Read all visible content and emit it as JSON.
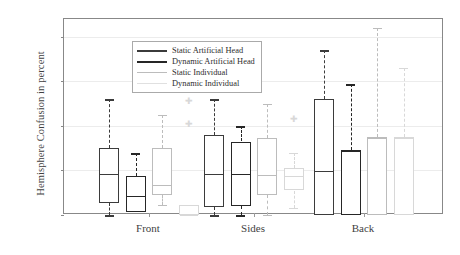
{
  "chart_data": {
    "type": "box",
    "title": "",
    "xlabel": "",
    "ylabel": "Hemisphere Confusion in percent",
    "ylim": [
      0,
      88
    ],
    "yticks": [
      0,
      20,
      40,
      60,
      80
    ],
    "ytick_labels": [
      "0",
      "20",
      "40",
      "60",
      "80"
    ],
    "grid": "horizontal",
    "categories": [
      "Front",
      "Sides",
      "Back"
    ],
    "legend_position": "top-left",
    "series": [
      {
        "name": "Static Artificial Head",
        "color": "#3b3b3b",
        "boxes": [
          {
            "category": "Front",
            "whisker_low": 0,
            "q1": 5.5,
            "median": 19,
            "q3": 30,
            "whisker_high": 52,
            "outliers": []
          },
          {
            "category": "Sides",
            "whisker_low": 0,
            "q1": 3.5,
            "median": 19,
            "q3": 36,
            "whisker_high": 52,
            "outliers": []
          },
          {
            "category": "Back",
            "whisker_low": 0,
            "q1": 0,
            "median": 20,
            "q3": 52,
            "whisker_high": 74,
            "outliers": []
          }
        ]
      },
      {
        "name": "Dynamic Artificial Head",
        "color": "#262626",
        "boxes": [
          {
            "category": "Front",
            "whisker_low": 1.5,
            "q1": 1.5,
            "median": 9,
            "q3": 17.5,
            "whisker_high": 28,
            "outliers": [
              62
            ]
          },
          {
            "category": "Sides",
            "whisker_low": 0,
            "q1": 4,
            "median": 19,
            "q3": 33,
            "whisker_high": 40,
            "outliers": []
          },
          {
            "category": "Back",
            "whisker_low": 0,
            "q1": 0,
            "median": 29,
            "q3": 29,
            "whisker_high": 59,
            "outliers": []
          }
        ]
      },
      {
        "name": "Static Individual",
        "color": "#bcbcbc",
        "boxes": [
          {
            "category": "Front",
            "whisker_low": 4.5,
            "q1": 9,
            "median": 14,
            "q3": 30,
            "whisker_high": 45,
            "outliers": [
              64
            ]
          },
          {
            "category": "Sides",
            "whisker_low": 0,
            "q1": 9,
            "median": 18.5,
            "q3": 34.5,
            "whisker_high": 50,
            "outliers": []
          },
          {
            "category": "Back",
            "whisker_low": 0,
            "q1": 0,
            "median": 35,
            "q3": 35,
            "whisker_high": 84,
            "outliers": []
          }
        ]
      },
      {
        "name": "Dynamic Individual",
        "color": "#d8d8d8",
        "boxes": [
          {
            "category": "Front",
            "whisker_low": 0,
            "q1": 0,
            "median": 0,
            "q3": 4.5,
            "whisker_high": 4.5,
            "outliers": [
              51,
              41
            ]
          },
          {
            "category": "Sides",
            "whisker_low": 3,
            "q1": 11,
            "median": 18,
            "q3": 21,
            "whisker_high": 28,
            "outliers": [
              43
            ]
          },
          {
            "category": "Back",
            "whisker_low": 0,
            "q1": 0,
            "median": 35,
            "q3": 35,
            "whisker_high": 66,
            "outliers": []
          }
        ]
      }
    ]
  }
}
